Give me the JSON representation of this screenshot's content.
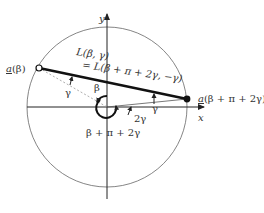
{
  "diagram": {
    "axes": {
      "x_label": "x",
      "y_label": "y"
    },
    "points": {
      "start": {
        "label_underlined": "a",
        "label_rest": "(β)",
        "style": "open"
      },
      "end": {
        "label_underlined": "a",
        "label_rest": "(β + π + 2γ)",
        "style": "filled"
      }
    },
    "line_label": {
      "line1": "L(β, γ)",
      "line2": "= L(β + π + 2γ, −γ)"
    },
    "angles": {
      "gamma_left": "γ",
      "beta": "β",
      "gamma_right": "γ",
      "two_gamma": "2γ",
      "big": "β + π + 2γ"
    },
    "colors": {
      "stroke": "#222222",
      "circle": "#555555",
      "dashed": "#888888"
    }
  }
}
